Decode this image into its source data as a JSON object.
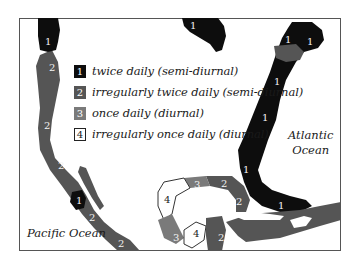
{
  "map": {
    "title": "Tide types of North American coasts",
    "colors": {
      "type1": "#0d0d0d",
      "type2": "#555555",
      "type3": "#7a7a7a",
      "type4": "#ffffff",
      "border": "#555555"
    },
    "legend": [
      {
        "code": "1",
        "label": "twice daily (semi-diurnal)"
      },
      {
        "code": "2",
        "label": "irregularly twice daily (semi-diurnal)"
      },
      {
        "code": "3",
        "label": "once daily (diurnal)"
      },
      {
        "code": "4",
        "label": "irregularly once daily (diurnal)"
      }
    ],
    "oceans": {
      "atlantic": [
        "Atlantic",
        "Ocean"
      ],
      "pacific": "Pacific Ocean"
    },
    "region_labels": [
      {
        "code": "1",
        "where": "Alaska panhandle"
      },
      {
        "code": "1",
        "where": "Hudson Bay"
      },
      {
        "code": "1",
        "where": "Labrador"
      },
      {
        "code": "1",
        "where": "Newfoundland"
      },
      {
        "code": "1",
        "where": "Nova Scotia"
      },
      {
        "code": "1",
        "where": "US East Coast north"
      },
      {
        "code": "1",
        "where": "US East Coast south"
      },
      {
        "code": "1",
        "where": "Florida east"
      },
      {
        "code": "1",
        "where": "Gulf of California"
      },
      {
        "code": "2",
        "where": "British Columbia"
      },
      {
        "code": "2",
        "where": "California north"
      },
      {
        "code": "2",
        "where": "Baja California"
      },
      {
        "code": "2",
        "where": "Mexico west"
      },
      {
        "code": "2",
        "where": "Mexico southwest"
      },
      {
        "code": "2",
        "where": "Gulf of St. Lawrence"
      },
      {
        "code": "2",
        "where": "Florida Gulf"
      },
      {
        "code": "2",
        "where": "Florida west"
      },
      {
        "code": "2",
        "where": "Cuba"
      },
      {
        "code": "2",
        "where": "Yucatan"
      },
      {
        "code": "3",
        "where": "Gulf north"
      },
      {
        "code": "3",
        "where": "Gulf southwest"
      },
      {
        "code": "4",
        "where": "Texas"
      },
      {
        "code": "4",
        "where": "Campeche"
      }
    ]
  }
}
